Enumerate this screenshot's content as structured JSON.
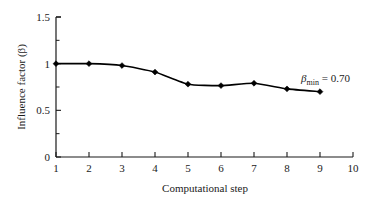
{
  "chart_data": {
    "type": "line",
    "title": "",
    "xlabel": "Computational step",
    "ylabel": "Influence factor (β)",
    "xlim": [
      1,
      10
    ],
    "ylim": [
      0,
      1.5
    ],
    "grid": false,
    "legend": false,
    "marker": "diamond",
    "line_color": "#000000",
    "x": [
      1,
      2,
      3,
      4,
      5,
      6,
      7,
      8,
      9
    ],
    "values": [
      1.0,
      1.0,
      0.98,
      0.91,
      0.78,
      0.765,
      0.79,
      0.73,
      0.7
    ],
    "series": [
      {
        "name": "Influence factor",
        "values": [
          1.0,
          1.0,
          0.98,
          0.91,
          0.78,
          0.765,
          0.79,
          0.73,
          0.7
        ]
      }
    ],
    "categories": [
      "1",
      "2",
      "3",
      "4",
      "5",
      "6",
      "7",
      "8",
      "9"
    ],
    "x_ticklabels": [
      "1",
      "2",
      "3",
      "4",
      "5",
      "6",
      "7",
      "8",
      "9",
      "10"
    ],
    "x_tickvalues": [
      1,
      2,
      3,
      4,
      5,
      6,
      7,
      8,
      9,
      10
    ],
    "y_ticklabels": [
      "0",
      "0.5",
      "1",
      "1.5"
    ],
    "y_tickvalues": [
      0,
      0.5,
      1,
      1.5
    ],
    "y_minor_tickvalues": [
      0.25,
      0.75,
      1.25
    ],
    "annotations": [
      {
        "symbol": "β",
        "subscript": "min",
        "relation": " = ",
        "value": "0.70",
        "full_text": "βmin = 0.70",
        "x": 8.4,
        "y": 0.96
      }
    ]
  },
  "axis": {
    "y_label": "Influence factor (β)",
    "x_label": "Computational step",
    "y_ticks": [
      "1.5",
      "1",
      "0.5",
      "0"
    ],
    "x_ticks": [
      "1",
      "2",
      "3",
      "4",
      "5",
      "6",
      "7",
      "8",
      "9",
      "10"
    ]
  },
  "annotation": {
    "beta_symbol": "β",
    "subscript": "min",
    "equals_value": " = 0.70"
  },
  "colors": {
    "line": "#000000",
    "marker": "#000000",
    "axis": "#1a1a1a",
    "background": "#ffffff"
  }
}
